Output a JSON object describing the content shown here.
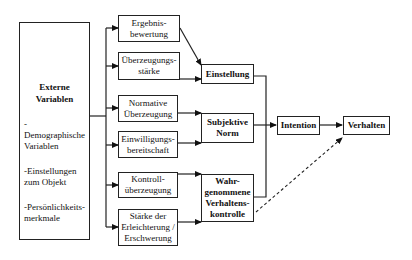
{
  "external": {
    "title": "Externe\nVariablen",
    "items": [
      "-Demographische\nVariablen",
      "-Einstellungen\nzum Objekt",
      "-Persönlichkeits-\nmerkmale"
    ]
  },
  "beliefs": [
    {
      "label": "Ergebnis-\nbewertung"
    },
    {
      "label": "Überzeugungs-\nstärke"
    },
    {
      "label": "Normative\nÜberzeugung"
    },
    {
      "label": "Einwilligungs-\nbereitschaft"
    },
    {
      "label": "Kontroll-\nüberzeugung"
    },
    {
      "label": "Stärke der\nErleichterung /\nErschwerung"
    }
  ],
  "constructs": {
    "attitude": "Einstellung",
    "subjective_norm": "Subjektive\nNorm",
    "pbc": "Wahr-\ngenommene\nVerhaltens-\nkontrolle",
    "intention": "Intention",
    "behavior": "Verhalten"
  }
}
